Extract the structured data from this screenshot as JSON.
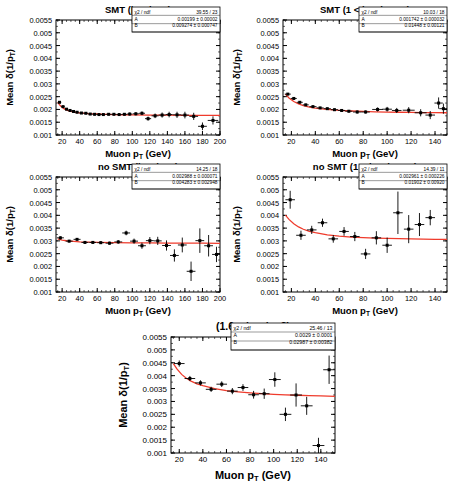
{
  "figure": {
    "axis_label_x": "Muon p_T (GeV)",
    "axis_label_y": "Mean δ(1/p_T)",
    "y_axis_symbol_parts": {
      "prefix": "Mean ",
      "delta": "δ",
      "open": "(1/p",
      "sub": "T",
      "close": ")"
    },
    "x_axis_symbol_parts": {
      "prefix": "Muon p",
      "sub": "T",
      "suffix": " (GeV)"
    },
    "stat_labels": {
      "chi2": "χ2 / ndf",
      "a": "A",
      "b": "B"
    },
    "marker_color": "#000000",
    "fit_color": "#ef3b2c",
    "frame_color": "#000000"
  },
  "chart_data": [
    {
      "id": "panel-smt-eta-lt-1",
      "type": "scatter",
      "title": "SMT (|η_det| < 1)",
      "title_parts": {
        "pre": "SMT (|η",
        "sub": "det",
        "post": "| < 1)"
      },
      "xlabel": "Muon p_T (GeV)",
      "ylabel": "Mean δ(1/p_T)",
      "xlim": [
        13,
        200
      ],
      "ylim": [
        0.001,
        0.0055
      ],
      "xticks": [
        20,
        40,
        60,
        80,
        100,
        120,
        140,
        160,
        180,
        200
      ],
      "yticks": [
        0.001,
        0.0015,
        0.002,
        0.0025,
        0.003,
        0.0035,
        0.004,
        0.0045,
        0.005,
        0.0055
      ],
      "ytick_labels": [
        "0.001",
        "0.0015",
        "0.002",
        "0.0025",
        "0.003",
        "0.0035",
        "0.004",
        "0.0045",
        "0.005",
        "0.0055"
      ],
      "grid": false,
      "fit": {
        "form": "A*(1+B*pt)",
        "A": 0.00199,
        "B": 0.009274,
        "curve_x": [
          15,
          18,
          22,
          26,
          30,
          35,
          40,
          50,
          60,
          70,
          80,
          90,
          100,
          120,
          140,
          160,
          180,
          200
        ],
        "curve_y": [
          0.002275,
          0.00214,
          0.00203,
          0.001965,
          0.001925,
          0.00189,
          0.001868,
          0.00184,
          0.001822,
          0.00181,
          0.0018,
          0.001793,
          0.001788,
          0.00178,
          0.001775,
          0.001771,
          0.001768,
          0.001765
        ]
      },
      "points": {
        "x": [
          17,
          21,
          25,
          29,
          33,
          37,
          42,
          47,
          52,
          57,
          62,
          67,
          73,
          79,
          85,
          91,
          97,
          104,
          111,
          118,
          126,
          134,
          142,
          151,
          160,
          170,
          180,
          192
        ],
        "y": [
          0.00228,
          0.00211,
          0.00201,
          0.00196,
          0.00192,
          0.00189,
          0.00186,
          0.00185,
          0.00182,
          0.00181,
          0.0018,
          0.0018,
          0.00181,
          0.00181,
          0.0018,
          0.00181,
          0.00182,
          0.00183,
          0.00185,
          0.00164,
          0.00175,
          0.00178,
          0.0018,
          0.00179,
          0.00178,
          0.00173,
          0.00134,
          0.00157
        ],
        "yerr": [
          3e-05,
          3e-05,
          3e-05,
          3e-05,
          3e-05,
          3e-05,
          3e-05,
          3e-05,
          3e-05,
          4e-05,
          4e-05,
          4e-05,
          4e-05,
          4e-05,
          5e-05,
          5e-05,
          6e-05,
          6e-05,
          7e-05,
          8e-05,
          9e-05,
          0.0001,
          0.00011,
          0.00012,
          0.00013,
          0.00014,
          0.00015,
          0.00016
        ],
        "xerr": [
          2,
          2,
          2,
          2,
          2,
          2,
          2.5,
          2.5,
          2.5,
          2.5,
          2.5,
          2.5,
          3,
          3,
          3,
          3,
          3,
          3.5,
          3.5,
          3.5,
          4,
          4,
          4,
          4.5,
          4.5,
          5,
          5,
          6
        ]
      },
      "stats": {
        "chi2_ndf": "39.55 / 23",
        "A": "0.00199 ± 0.00002",
        "B": "0.009274 ± 0.000747"
      }
    },
    {
      "id": "panel-smt-eta-1-1p6",
      "type": "scatter",
      "title": "SMT (1 < |η_det| < 1.6)",
      "title_parts": {
        "pre": "SMT (1 < |η",
        "sub": "det",
        "post": "| < 1.6)"
      },
      "xlabel": "Muon p_T (GeV)",
      "ylabel": "Mean δ(1/p_T)",
      "xlim": [
        13,
        150
      ],
      "ylim": [
        0.001,
        0.0055
      ],
      "xticks": [
        20,
        40,
        60,
        80,
        100,
        120,
        140
      ],
      "yticks": [
        0.001,
        0.0015,
        0.002,
        0.0025,
        0.003,
        0.0035,
        0.004,
        0.0045,
        0.005,
        0.0055
      ],
      "ytick_labels": [
        "0.001",
        "0.0015",
        "0.002",
        "0.0025",
        "0.003",
        "0.0035",
        "0.004",
        "0.0045",
        "0.005",
        "0.0055"
      ],
      "grid": false,
      "fit": {
        "form": "A*(1+B*pt)",
        "A": 0.001742,
        "B": 0.01448,
        "curve_x": [
          15,
          18,
          22,
          26,
          30,
          35,
          40,
          50,
          60,
          70,
          80,
          90,
          100,
          110,
          120,
          130,
          140,
          150
        ],
        "curve_y": [
          0.0026,
          0.00245,
          0.00231,
          0.002215,
          0.00215,
          0.002095,
          0.002055,
          0.002,
          0.001965,
          0.00194,
          0.001922,
          0.001908,
          0.001898,
          0.00189,
          0.001884,
          0.001878,
          0.001874,
          0.00187
        ]
      },
      "points": {
        "x": [
          17,
          22,
          27,
          32,
          38,
          44,
          50,
          56,
          62,
          68,
          75,
          82,
          92,
          100,
          108,
          118,
          128,
          136,
          143,
          147
        ],
        "y": [
          0.0026,
          0.00243,
          0.00228,
          0.00218,
          0.00211,
          0.00206,
          0.00203,
          0.00199,
          0.00196,
          0.00193,
          0.0019,
          0.0019,
          0.002,
          0.00201,
          0.00196,
          0.00197,
          0.00187,
          0.00178,
          0.00225,
          0.00203
        ],
        "yerr": [
          4e-05,
          4e-05,
          4e-05,
          4e-05,
          4e-05,
          4e-05,
          4e-05,
          5e-05,
          5e-05,
          5e-05,
          6e-05,
          6e-05,
          8e-05,
          9e-05,
          0.0001,
          0.00012,
          0.00014,
          0.00016,
          0.00022,
          0.0002
        ],
        "xerr": [
          2.5,
          2.5,
          2.5,
          2.5,
          3,
          3,
          3,
          3,
          3,
          3,
          3.5,
          3.5,
          4.5,
          4,
          4,
          5,
          5,
          4,
          3.5,
          3.5
        ]
      },
      "stats": {
        "chi2_ndf": "10.03 / 18",
        "A": "0.001742 ± 0.000032",
        "B": "0.01448 ± 0.00121"
      }
    },
    {
      "id": "panel-nosmt-eta-lt-1",
      "type": "scatter",
      "title": "no SMT (|η_det| < 1)",
      "title_parts": {
        "pre": "no SMT (|η",
        "sub": "det",
        "post": "| < 1)"
      },
      "xlabel": "Muon p_T (GeV)",
      "ylabel": "Mean δ(1/p_T)",
      "xlim": [
        13,
        200
      ],
      "ylim": [
        0.001,
        0.0055
      ],
      "xticks": [
        20,
        40,
        60,
        80,
        100,
        120,
        140,
        160,
        180,
        200
      ],
      "yticks": [
        0.001,
        0.0015,
        0.002,
        0.0025,
        0.003,
        0.0035,
        0.004,
        0.0045,
        0.005,
        0.0055
      ],
      "ytick_labels": [
        "0.001",
        "0.0015",
        "0.002",
        "0.0025",
        "0.003",
        "0.0035",
        "0.004",
        "0.0045",
        "0.005",
        "0.0055"
      ],
      "grid": false,
      "fit": {
        "form": "A*(1+B*pt)",
        "A": 0.002988,
        "B": 0.004283,
        "curve_x": [
          15,
          20,
          25,
          30,
          40,
          50,
          60,
          80,
          100,
          120,
          140,
          160,
          180,
          200
        ],
        "curve_y": [
          0.003075,
          0.00303,
          0.003005,
          0.00299,
          0.002965,
          0.002952,
          0.002944,
          0.002933,
          0.002926,
          0.00292,
          0.002916,
          0.002912,
          0.002909,
          0.002906
        ]
      },
      "points": {
        "x": [
          18,
          28,
          37,
          46,
          55,
          64,
          74,
          84,
          93,
          102,
          111,
          120,
          129,
          139,
          148,
          157,
          167,
          177,
          187,
          196
        ],
        "y": [
          0.00312,
          0.00299,
          0.00306,
          0.00294,
          0.00294,
          0.00293,
          0.00291,
          0.00296,
          0.00331,
          0.00299,
          0.00281,
          0.00301,
          0.003,
          0.00282,
          0.00243,
          0.00284,
          0.00181,
          0.00301,
          0.00281,
          0.00247
        ],
        "yerr": [
          6e-05,
          5e-05,
          5e-05,
          5e-05,
          5e-05,
          5e-05,
          6e-05,
          7e-05,
          9e-05,
          0.0001,
          0.00012,
          0.00014,
          0.00016,
          0.0002,
          0.00024,
          0.00029,
          0.00038,
          0.00048,
          0.00042,
          0.0003
        ],
        "xerr": [
          4,
          4,
          4,
          4,
          4,
          4,
          4.5,
          4.5,
          4.5,
          4.5,
          4.5,
          4.5,
          4.5,
          5,
          5,
          5,
          5,
          5,
          5,
          5
        ]
      },
      "stats": {
        "chi2_ndf": "14.25 / 18",
        "A": "0.002988 ± 0.000071",
        "B": "0.004283 ± 0.002948"
      }
    },
    {
      "id": "panel-nosmt-eta-1-1p6",
      "type": "scatter",
      "title": "no SMT (1 < |η_det| < 1.6)",
      "title_parts": {
        "pre": "no SMT (1 < |η",
        "sub": "det",
        "post": "| < 1.6)"
      },
      "xlabel": "Muon p_T (GeV)",
      "ylabel": "Mean δ(1/p_T)",
      "xlim": [
        13,
        150
      ],
      "ylim": [
        0.001,
        0.0055
      ],
      "xticks": [
        20,
        40,
        60,
        80,
        100,
        120,
        140
      ],
      "yticks": [
        0.001,
        0.0015,
        0.002,
        0.0025,
        0.003,
        0.0035,
        0.004,
        0.0045,
        0.005,
        0.0055
      ],
      "ytick_labels": [
        "0.001",
        "0.0015",
        "0.002",
        "0.0025",
        "0.003",
        "0.0035",
        "0.004",
        "0.0045",
        "0.005",
        "0.0055"
      ],
      "grid": false,
      "fit": {
        "form": "A*(1+B*pt)",
        "A": 0.002961,
        "B": 0.01902,
        "curve_x": [
          15,
          18,
          22,
          26,
          30,
          35,
          40,
          50,
          60,
          70,
          80,
          90,
          100,
          110,
          120,
          130,
          140,
          150
        ],
        "curve_y": [
          0.00401,
          0.00384,
          0.00367,
          0.003545,
          0.003455,
          0.003375,
          0.00332,
          0.003235,
          0.003185,
          0.00315,
          0.003125,
          0.003108,
          0.003095,
          0.003085,
          0.003075,
          0.003068,
          0.003062,
          0.003057
        ]
      },
      "points": {
        "x": [
          19,
          28,
          37,
          46,
          55,
          64,
          73,
          82,
          91,
          100,
          109,
          118,
          127,
          136
        ],
        "y": [
          0.00461,
          0.00322,
          0.00343,
          0.00371,
          0.00308,
          0.00337,
          0.00317,
          0.00249,
          0.00312,
          0.00283,
          0.0041,
          0.00346,
          0.00364,
          0.00391
        ],
        "yerr": [
          0.00035,
          0.00018,
          0.00016,
          0.00016,
          0.00015,
          0.00017,
          0.00018,
          0.0002,
          0.00026,
          0.0003,
          0.00083,
          0.00055,
          0.00045,
          0.0003
        ],
        "xerr": [
          4,
          4,
          4,
          4,
          4,
          4,
          4,
          4,
          4,
          4,
          4,
          4,
          4,
          4
        ]
      },
      "stats": {
        "chi2_ndf": "14.39 / 11",
        "A": "0.002961 ± 0.000226",
        "B": "0.01902 ± 0.00920"
      }
    },
    {
      "id": "panel-eta-1p6-2",
      "type": "scatter",
      "title": "(1.6 < |η_det| < 2)",
      "title_parts": {
        "pre": "(1.6 < |η",
        "sub": "det",
        "post": "| < 2)"
      },
      "xlabel": "Muon p_T (GeV)",
      "ylabel": "Mean δ(1/p_T)",
      "xlim": [
        13,
        152
      ],
      "ylim": [
        0.001,
        0.0055
      ],
      "xticks": [
        20,
        40,
        60,
        80,
        100,
        120,
        140
      ],
      "yticks": [
        0.001,
        0.0015,
        0.002,
        0.0025,
        0.003,
        0.0035,
        0.004,
        0.0045,
        0.005,
        0.0055
      ],
      "ytick_labels": [
        "0.001",
        "0.0015",
        "0.002",
        "0.0025",
        "0.003",
        "0.0035",
        "0.004",
        "0.0045",
        "0.005",
        "0.0055"
      ],
      "grid": false,
      "fit": {
        "form": "A*(1+B*pt)",
        "A": 0.0029,
        "B": 0.02987,
        "curve_x": [
          15,
          18,
          22,
          26,
          30,
          35,
          40,
          50,
          60,
          70,
          80,
          90,
          100,
          110,
          120,
          130,
          140,
          152
        ],
        "curve_y": [
          0.00447,
          0.00426,
          0.00405,
          0.0039,
          0.00379,
          0.003685,
          0.00361,
          0.003495,
          0.00342,
          0.00337,
          0.00333,
          0.0033,
          0.003275,
          0.003255,
          0.00324,
          0.003225,
          0.003215,
          0.0032
        ]
      },
      "points": {
        "x": [
          20,
          29,
          38,
          47,
          56,
          65,
          74,
          83,
          92,
          101,
          110,
          119,
          128,
          138,
          147
        ],
        "y": [
          0.00447,
          0.00389,
          0.00372,
          0.00347,
          0.00367,
          0.0034,
          0.00354,
          0.00326,
          0.0033,
          0.00385,
          0.0025,
          0.00325,
          0.00283,
          0.00129,
          0.00423
        ],
        "yerr": [
          0.00012,
          0.0001,
          0.0001,
          0.0001,
          0.00011,
          0.00012,
          0.00013,
          0.00015,
          0.0002,
          0.00028,
          0.00026,
          0.00045,
          0.00035,
          0.0003,
          0.00055
        ],
        "xerr": [
          4.5,
          4.5,
          4.5,
          4.5,
          4.5,
          4.5,
          4.5,
          4.5,
          4.5,
          5,
          5,
          5,
          5,
          5,
          5
        ]
      },
      "stats": {
        "chi2_ndf": "25.46 / 13",
        "A": "0.0029 ± 0.0001",
        "B": "0.02987 ± 0.00382"
      }
    }
  ]
}
